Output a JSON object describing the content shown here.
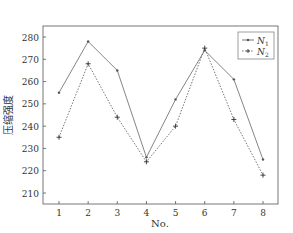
{
  "chart_data": {
    "type": "line",
    "title": "",
    "xlabel": "No.",
    "ylabel": "压缩强度",
    "categories": [
      "1",
      "2",
      "3",
      "4",
      "5",
      "6",
      "7",
      "8"
    ],
    "x": [
      1,
      2,
      3,
      4,
      5,
      6,
      7,
      8
    ],
    "ylim": [
      205,
      285
    ],
    "yticks": [
      210,
      220,
      230,
      240,
      250,
      260,
      270,
      280
    ],
    "grid": false,
    "legend_position": "upper right",
    "series": [
      {
        "name": "N1",
        "label_main": "N",
        "label_sub": "1",
        "style": "solid",
        "marker": "dot",
        "values": [
          255,
          278,
          265,
          226,
          252,
          274,
          261,
          225
        ]
      },
      {
        "name": "N2",
        "label_main": "N",
        "label_sub": "2",
        "style": "dotted",
        "marker": "plus",
        "values": [
          235,
          268,
          244,
          224,
          240,
          275,
          243,
          218
        ]
      }
    ]
  }
}
